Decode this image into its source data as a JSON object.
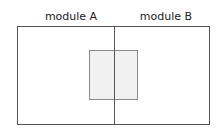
{
  "diagram": {
    "modules": [
      {
        "label": "module A"
      },
      {
        "label": "module B"
      }
    ],
    "overlap_region": {
      "fill": "#f1f1f1",
      "border": "#8a8a8a"
    },
    "outline_color": "#555555"
  }
}
